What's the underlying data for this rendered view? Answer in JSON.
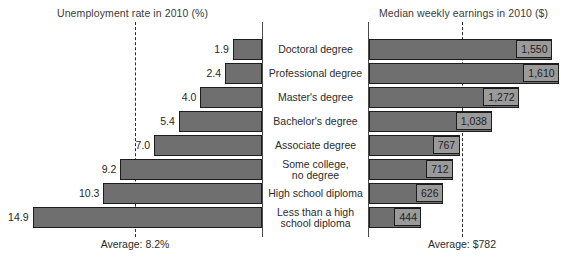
{
  "chart_data": {
    "type": "bar",
    "title": "",
    "subtitle": "",
    "orientation": "horizontal",
    "layout": "butterfly-pyramid-two-panel",
    "categories": [
      "Doctoral degree",
      "Professional degree",
      "Master's degree",
      "Bachelor's degree",
      "Associate degree",
      "Some college,\nno degree",
      "High school diploma",
      "Less than a high\nschool diploma"
    ],
    "panels": [
      {
        "id": "unemployment",
        "title": "Unemployment rate in 2010 (%)",
        "xlabel": "Unemployment rate in 2010 (%)",
        "ylabel": "",
        "direction": "left",
        "unit": "%",
        "xlim": [
          0,
          15
        ],
        "grid": false,
        "values": [
          1.9,
          2.4,
          4.0,
          5.4,
          7.0,
          9.2,
          10.3,
          14.9
        ],
        "value_labels": [
          "1.9",
          "2.4",
          "4.0",
          "5.4",
          "7.0",
          "9.2",
          "10.3",
          "14.9"
        ],
        "reference_line": {
          "value": 8.2,
          "label": "Average: 8.2%",
          "style": "dashed"
        }
      },
      {
        "id": "earnings",
        "title": "Median weekly earnings in 2010 ($)",
        "xlabel": "Median weekly earnings in 2010 ($)",
        "ylabel": "",
        "direction": "right",
        "unit": "$",
        "xlim": [
          0,
          1700
        ],
        "grid": false,
        "values": [
          1550,
          1610,
          1272,
          1038,
          767,
          712,
          626,
          444
        ],
        "value_labels": [
          "1,550",
          "1,610",
          "1,272",
          "1,038",
          "767",
          "712",
          "626",
          "444"
        ],
        "reference_line": {
          "value": 782,
          "label": "Average: $782",
          "style": "dashed"
        }
      }
    ],
    "colors": {
      "bar_fill": "#6f6f6f",
      "bar_stroke": "#1c1c1c",
      "label_box_fill": "#9a9a9a",
      "axis": "#4a4a4a",
      "reference_line": "#2b2b2b",
      "text": "#2b2b2b",
      "background": "#ffffff"
    }
  }
}
